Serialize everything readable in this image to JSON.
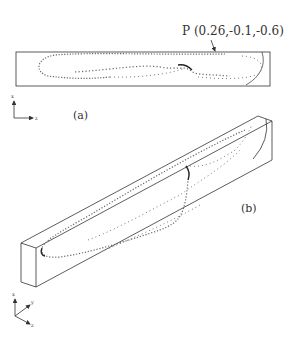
{
  "figure": {
    "annotation_point": "P (0.26,-0.1,-0.6)",
    "panel_a_label": "(a)",
    "panel_b_label": "(b)",
    "axis_a": {
      "vertical": "x",
      "horizontal": "z"
    },
    "axis_b": {
      "vertical": "x",
      "upper_diag": "y",
      "lower_diag": "z"
    },
    "colors": {
      "line": "#333333",
      "marker": "#555555",
      "background": "#ffffff"
    }
  }
}
